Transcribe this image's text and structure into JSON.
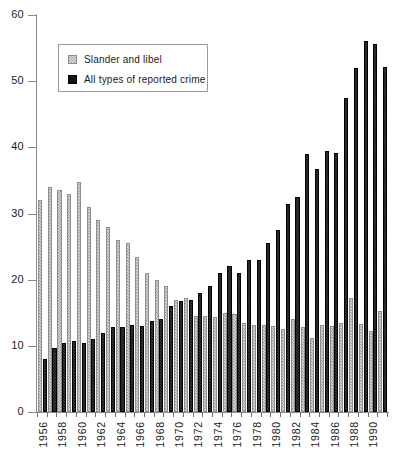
{
  "chart_data": {
    "type": "bar",
    "title": "",
    "subtitle": "",
    "xlabel": "",
    "ylabel": "",
    "ylim": [
      0,
      60
    ],
    "ytick_step": 10,
    "yticks": [
      0,
      10,
      20,
      30,
      40,
      50,
      60
    ],
    "grid": false,
    "legend_position": "top-left",
    "categories": [
      "1956",
      "1957",
      "1958",
      "1959",
      "1960",
      "1961",
      "1962",
      "1963",
      "1964",
      "1965",
      "1966",
      "1967",
      "1968",
      "1969",
      "1970",
      "1971",
      "1972",
      "1973",
      "1974",
      "1975",
      "1976",
      "1977",
      "1978",
      "1979",
      "1980",
      "1981",
      "1982",
      "1983",
      "1984",
      "1985",
      "1986",
      "1987",
      "1988",
      "1989",
      "1990",
      "1991"
    ],
    "tick_labels": [
      "1956",
      "",
      "1958",
      "",
      "1960",
      "",
      "1962",
      "",
      "1964",
      "",
      "1966",
      "",
      "1968",
      "",
      "1970",
      "",
      "1972",
      "",
      "1974",
      "",
      "1976",
      "",
      "1978",
      "",
      "1980",
      "",
      "1982",
      "",
      "1984",
      "",
      "1986",
      "",
      "1988",
      "",
      "1990",
      ""
    ],
    "series": [
      {
        "name": "Slander and libel",
        "color": "#a5a5a5",
        "values": [
          32.0,
          34.0,
          33.5,
          33.0,
          34.7,
          31.0,
          29.0,
          28.0,
          26.0,
          25.5,
          23.5,
          21.0,
          20.0,
          19.0,
          17.0,
          17.2,
          14.5,
          14.5,
          14.3,
          15.0,
          14.8,
          13.5,
          13.2,
          13.2,
          13.0,
          12.5,
          14.0,
          12.8,
          11.2,
          13.2,
          13.0,
          13.5,
          17.2,
          13.3,
          12.3,
          15.2
        ]
      },
      {
        "name": "All types of reported crime",
        "color": "#141414",
        "values": [
          8.0,
          9.6,
          10.5,
          10.8,
          10.5,
          11.0,
          12.0,
          12.8,
          12.8,
          13.2,
          13.0,
          13.8,
          14.0,
          16.0,
          16.8,
          17.0,
          18.0,
          19.0,
          21.0,
          22.0,
          21.0,
          23.0,
          23.0,
          25.5,
          27.5,
          31.5,
          32.5,
          39.0,
          36.7,
          39.5,
          39.2,
          47.5,
          52.0,
          56.0,
          55.6,
          52.2
        ]
      }
    ]
  },
  "legend": {
    "items": [
      {
        "label": "Slander and libel",
        "swatch": "slander"
      },
      {
        "label": "All types of reported crime",
        "swatch": "allcrime"
      }
    ]
  }
}
